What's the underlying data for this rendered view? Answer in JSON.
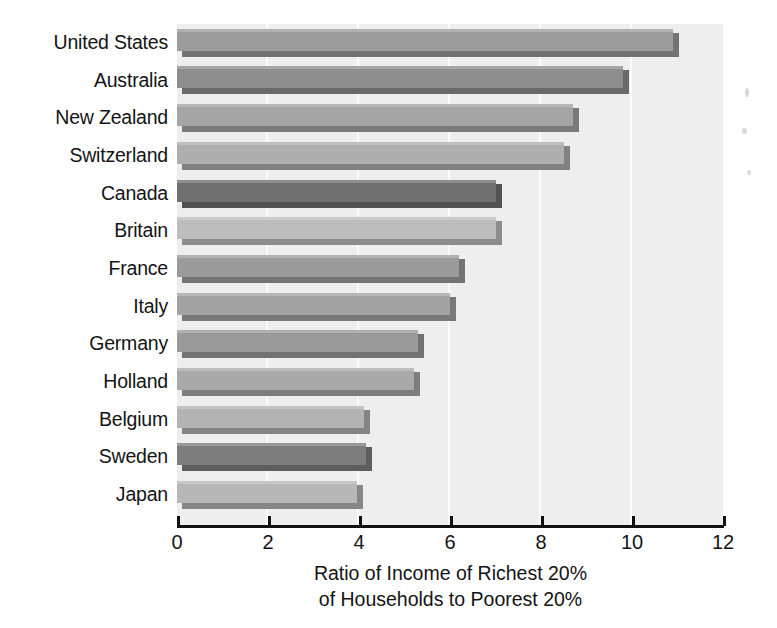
{
  "chart_data": {
    "type": "bar",
    "orientation": "horizontal",
    "title": "",
    "xlabel": "Ratio of Income of Richest 20% of Households to Poorest 20%",
    "xlabel_lines": [
      "Ratio of Income of Richest 20%",
      "of Households to Poorest 20%"
    ],
    "ylabel": "",
    "xlim": [
      0,
      12
    ],
    "xticks": [
      0,
      2,
      4,
      6,
      8,
      10,
      12
    ],
    "xtick_labels": [
      "0",
      "2",
      "4",
      "6",
      "8",
      "10",
      "12"
    ],
    "grid": "vertical-light",
    "legend": "none",
    "categories": [
      "United States",
      "Australia",
      "New Zealand",
      "Switzerland",
      "Canada",
      "Britain",
      "France",
      "Italy",
      "Germany",
      "Holland",
      "Belgium",
      "Sweden",
      "Japan"
    ],
    "values": [
      10.9,
      9.8,
      8.7,
      8.5,
      7.0,
      7.0,
      6.2,
      6.0,
      5.3,
      5.2,
      4.1,
      4.15,
      3.95
    ],
    "bar_colors": [
      "#9c9c9c",
      "#8e8e8e",
      "#a5a5a5",
      "#aeaeae",
      "#6f6f6f",
      "#bdbdbd",
      "#9b9b9b",
      "#a3a3a3",
      "#9a9a9a",
      "#a9a9a9",
      "#b3b3b3",
      "#7d7d7d",
      "#b7b7b7"
    ],
    "plot_background": "#eeeeee",
    "axis_color": "#111111",
    "text_color": "#141414"
  }
}
